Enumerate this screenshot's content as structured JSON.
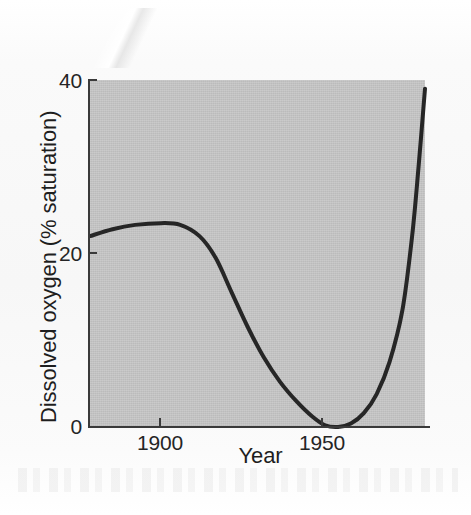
{
  "figure": {
    "alt": "Line graph of dissolved oxygen percent saturation versus year"
  },
  "chart_data": {
    "type": "line",
    "title": "",
    "subtitle": "",
    "xlabel": "Year",
    "ylabel": "Dissolved oxygen (% saturation)",
    "xlim": [
      1878,
      1982
    ],
    "ylim": [
      0,
      40
    ],
    "xticks": [
      1900,
      1950
    ],
    "xticklabels": [
      "1900",
      "1950"
    ],
    "yticks": [
      0,
      20,
      40
    ],
    "yticklabels": [
      "0",
      "20",
      "40"
    ],
    "grid": false,
    "legend": null,
    "legend_position": "none",
    "plot_background": "#c6c6c6",
    "line_color": "#262626",
    "line_width": 4,
    "series": [
      {
        "name": "Dissolved oxygen",
        "x": [
          1878,
          1885,
          1892,
          1900,
          1906,
          1912,
          1917,
          1922,
          1927,
          1932,
          1937,
          1942,
          1947,
          1951,
          1955,
          1959,
          1963,
          1967,
          1971,
          1975,
          1978,
          1980,
          1982
        ],
        "values": [
          22.0,
          22.8,
          23.3,
          23.5,
          23.3,
          22.0,
          19.5,
          15.5,
          11.5,
          8.0,
          5.2,
          3.0,
          1.2,
          0.2,
          0.0,
          0.4,
          1.6,
          3.8,
          7.5,
          13.5,
          22.0,
          30.0,
          39.0
        ]
      }
    ],
    "annotations": []
  },
  "axes": {
    "y_title": "Dissolved oxygen (% saturation)",
    "x_title": "Year",
    "y_tick_0": "0",
    "y_tick_20": "20",
    "y_tick_40": "40",
    "x_tick_1900": "1900",
    "x_tick_1950": "1950"
  }
}
